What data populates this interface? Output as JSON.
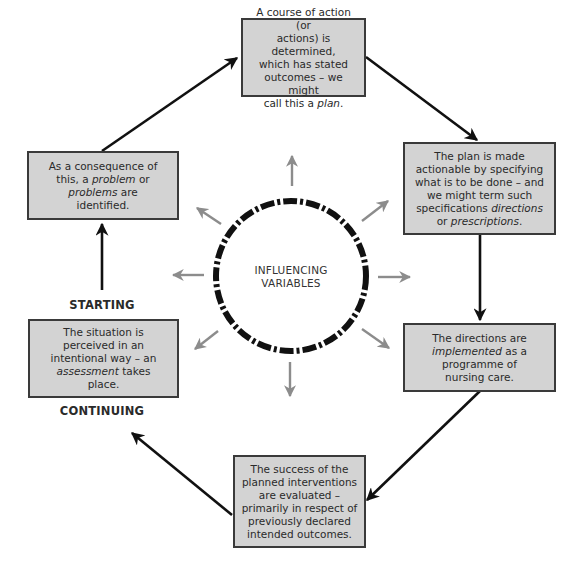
{
  "diagram": {
    "center": {
      "line1": "INFLUENCING",
      "line2": "VARIABLES"
    },
    "labels": {
      "starting": "STARTING",
      "continuing": "CONTINUING"
    },
    "boxes": {
      "plan": [
        {
          "t": "A course of action (or"
        },
        {
          "t": "actions) is determined,"
        },
        {
          "t": "which has stated"
        },
        {
          "t": "outcomes – we might"
        },
        {
          "t": "call this a ",
          "i": "plan",
          "a": "."
        }
      ],
      "directions": [
        {
          "t": "The plan is made"
        },
        {
          "t": "actionable by specifying"
        },
        {
          "t": "what is to be done – and"
        },
        {
          "t": "we might term such"
        },
        {
          "t": "specifications ",
          "i": "directions"
        },
        {
          "t": "or ",
          "i": "prescriptions",
          "a": "."
        }
      ],
      "implemented": [
        {
          "t": "The directions are"
        },
        {
          "t": "",
          "i": "implemented",
          "a": " as a"
        },
        {
          "t": "programme of"
        },
        {
          "t": "nursing care."
        }
      ],
      "evaluated": [
        {
          "t": "The success of the"
        },
        {
          "t": "planned interventions"
        },
        {
          "t": "are evaluated –"
        },
        {
          "t": "primarily in respect of"
        },
        {
          "t": "previously declared"
        },
        {
          "t": "intended outcomes."
        }
      ],
      "assessment": [
        {
          "t": "The situation is"
        },
        {
          "t": "perceived in an"
        },
        {
          "t": "intentional way – an"
        },
        {
          "t": "",
          "i": "assessment",
          "a": " takes"
        },
        {
          "t": "place."
        }
      ],
      "problem": [
        {
          "t": "As a consequence of"
        },
        {
          "t": "this, a ",
          "i": "problem",
          "a": " or"
        },
        {
          "t": "",
          "i": "problems",
          "a": " are"
        },
        {
          "t": "identified."
        }
      ]
    },
    "colors": {
      "box_fill": "#d3d3d3",
      "box_border": "#3a3a3a",
      "cycle_arrow": "#111111",
      "influence_arrow": "#8c8c8c",
      "ring": "#111111"
    }
  }
}
